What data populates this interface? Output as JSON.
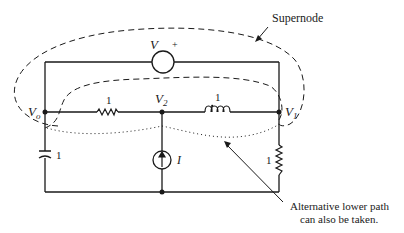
{
  "diagram": {
    "type": "circuit",
    "annotations": {
      "supernode": "Supernode",
      "alt_path_line1": "Alternative lower path",
      "alt_path_line2": "can also be taken."
    },
    "nodes": {
      "v0": {
        "label": "V",
        "sub": "o"
      },
      "v1": {
        "label": "V",
        "sub": "1"
      },
      "v2": {
        "label": "V",
        "sub": "2"
      }
    },
    "components": {
      "voltage_source": {
        "label": "V",
        "polarity": "+"
      },
      "resistor_middle": {
        "value": "1"
      },
      "inductor": {
        "value": "1"
      },
      "current_source": {
        "label": "I"
      },
      "capacitor": {
        "value": "1"
      },
      "resistor_right": {
        "value": "1"
      }
    },
    "colors": {
      "ink": "#1a1a1a",
      "background": "#ffffff"
    }
  }
}
